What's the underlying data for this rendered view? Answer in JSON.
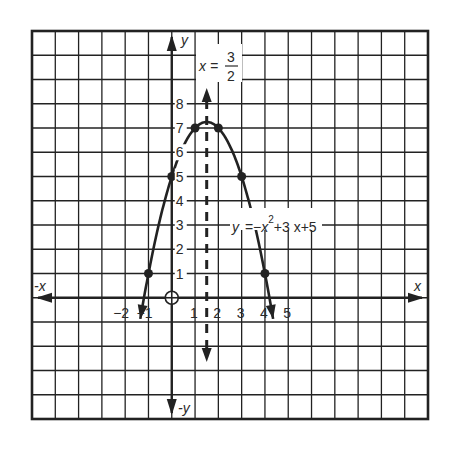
{
  "chart_data": {
    "type": "line",
    "title": "",
    "xlabel": "x",
    "ylabel": "y",
    "neg_xlabel": "-x",
    "neg_ylabel": "-y",
    "equation": "y = -x^2 + 3x + 5",
    "equation_label": {
      "lhs": "y",
      "eq": "=",
      "rhs_a": "−x",
      "exp": "2",
      "rhs_b": "+3 x+5"
    },
    "axis_of_symmetry": {
      "x": 1.5,
      "label_lhs": "x =",
      "num": "3",
      "den": "2",
      "style": "dashed"
    },
    "vertex": [
      1.5,
      7.25
    ],
    "xlim": [
      -6,
      11
    ],
    "ylim": [
      -5,
      11
    ],
    "grid": true,
    "x_ticks": [
      "−2",
      "−1",
      "1",
      "2",
      "3",
      "4",
      "5"
    ],
    "y_ticks": [
      "1",
      "2",
      "3",
      "4",
      "5",
      "6",
      "7",
      "8"
    ],
    "origin_marker": "circle-plus",
    "points": [
      {
        "x": -1,
        "y": 1
      },
      {
        "x": 0,
        "y": 5
      },
      {
        "x": 1,
        "y": 7
      },
      {
        "x": 2,
        "y": 7
      },
      {
        "x": 3,
        "y": 5
      },
      {
        "x": 4,
        "y": 1
      }
    ],
    "curve_x_range": [
      -1.35,
      4.35
    ],
    "line_color": "#222222",
    "grid_color": "#222222"
  }
}
